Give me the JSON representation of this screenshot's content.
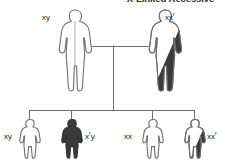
{
  "title": "X-Linked Recessive",
  "diagram": {
    "type": "pedigree",
    "generations": 2,
    "legend_note": "open = unaffected, half-shaded = carrier, filled = affected"
  },
  "parents": [
    {
      "role": "father",
      "sex": "male",
      "genotype_base": "xy",
      "genotype_sup": "",
      "status": "unaffected",
      "fill": "none"
    },
    {
      "role": "mother",
      "sex": "female",
      "genotype_base": "xx",
      "genotype_sup": "r",
      "status": "carrier",
      "fill": "half"
    }
  ],
  "children": [
    {
      "index": 1,
      "sex": "male",
      "genotype_base": "xy",
      "genotype_sup": "",
      "status": "unaffected",
      "fill": "none"
    },
    {
      "index": 2,
      "sex": "male",
      "genotype_base": "x",
      "genotype_sup": "r",
      "genotype_tail": "y",
      "status": "affected",
      "fill": "full"
    },
    {
      "index": 3,
      "sex": "female",
      "genotype_base": "xx",
      "genotype_sup": "",
      "status": "unaffected",
      "fill": "none"
    },
    {
      "index": 4,
      "sex": "female",
      "genotype_base": "xx",
      "genotype_sup": "r",
      "status": "carrier",
      "fill": "half"
    }
  ],
  "colors": {
    "outline": "#6e6e6e",
    "dark_fill": "#3a3a3a",
    "line": "#6e6e6e",
    "background": "#ffffff",
    "text": "#1a1a1a",
    "title_text": "#2b2b2b"
  }
}
